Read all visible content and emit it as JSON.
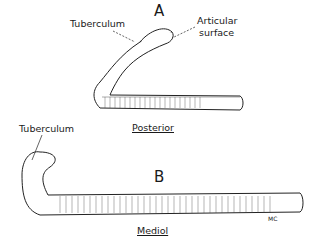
{
  "figure": {
    "panel_a": {
      "letter": "A",
      "labels": {
        "tuberculum": "Tuberculum",
        "articular_line1": "Articular",
        "articular_line2": "surface"
      },
      "view": "Posterior"
    },
    "panel_b": {
      "letter": "B",
      "labels": {
        "tuberculum": "Tuberculum"
      },
      "view": "Mediol"
    },
    "signature": "MC"
  }
}
